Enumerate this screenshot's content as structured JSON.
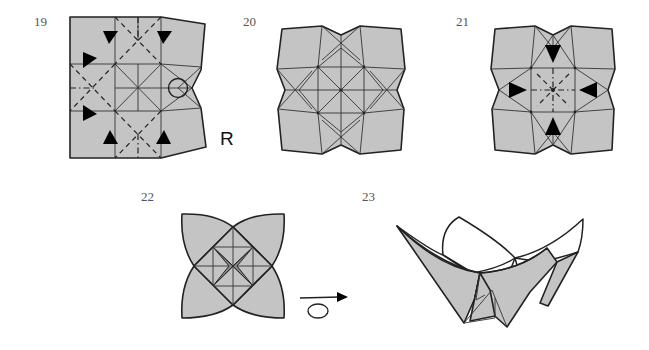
{
  "figure": {
    "type": "origami-instruction-diagram",
    "paper_color": "#c4c4c4",
    "line_color": "#222222",
    "background": "#ffffff"
  },
  "steps": [
    {
      "number": "19",
      "side_label": "R",
      "markers": [
        "valley-fold-lines",
        "mountain-fold-lines",
        "push-arrows",
        "circle-reference-point"
      ]
    },
    {
      "number": "20",
      "markers": [
        "crease-pattern"
      ]
    },
    {
      "number": "21",
      "markers": [
        "push-arrows",
        "valley-fold-lines",
        "mountain-fold-lines"
      ]
    },
    {
      "number": "22",
      "markers": [
        "four-petal-shape",
        "turn-over-arrow"
      ]
    },
    {
      "number": "23",
      "markers": [
        "finished-bowl"
      ]
    }
  ]
}
